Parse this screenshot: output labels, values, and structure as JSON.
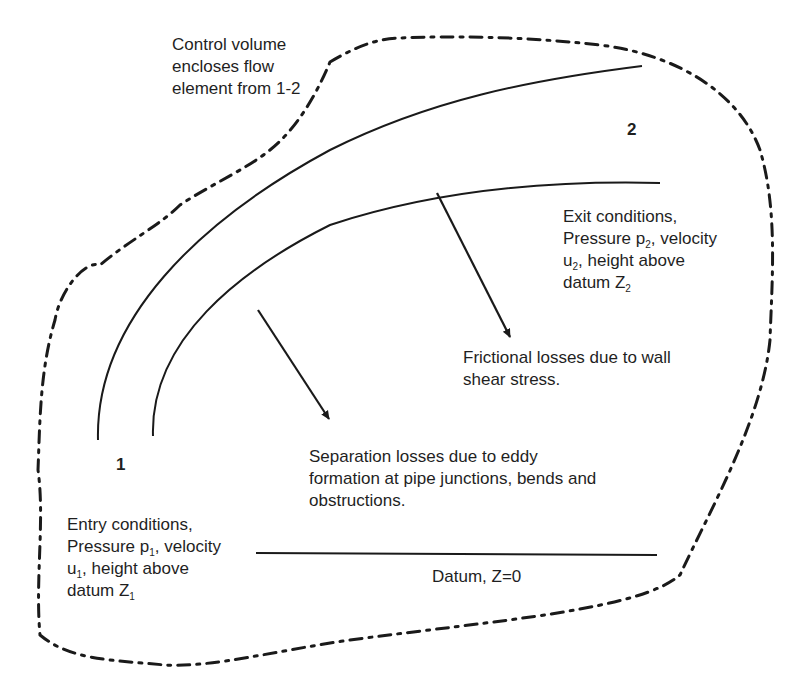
{
  "diagram": {
    "colors": {
      "ink": "#1a1a1a",
      "background": "#ffffff"
    },
    "control_volume_label": [
      "Control volume",
      "encloses flow",
      "element from 1-2"
    ],
    "station_1": "1",
    "station_2": "2",
    "exit_conditions": {
      "line1": "Exit conditions,",
      "line2_pre": "Pressure p",
      "line2_sub": "2",
      "line2_post": ", velocity",
      "line3_pre": "u",
      "line3_sub": "2",
      "line3_post": ", height above",
      "line4_pre": "datum Z",
      "line4_sub": "2"
    },
    "entry_conditions": {
      "line1": "Entry conditions,",
      "line2_pre": "Pressure p",
      "line2_sub": "1",
      "line2_post": ", velocity",
      "line3_pre": "u",
      "line3_sub": "1",
      "line3_post": ", height above",
      "line4_pre": "datum Z",
      "line4_sub": "1"
    },
    "frictional_losses": [
      "Frictional losses due to wall",
      "shear stress."
    ],
    "separation_losses": [
      "Separation losses due to eddy",
      "formation at pipe junctions, bends and",
      "obstructions."
    ],
    "datum_label": "Datum, Z=0"
  }
}
